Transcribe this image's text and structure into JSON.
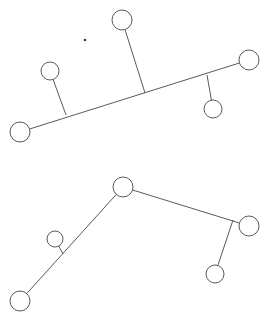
{
  "canvas": {
    "width": 272,
    "height": 322,
    "background": "#ffffff",
    "stroke_color": "#5a5a5a",
    "node_fill": "#ffffff",
    "stroke_width": 1
  },
  "diagram": {
    "type": "node-link-diagram",
    "graphs": [
      {
        "id": "graph-top",
        "label": "top-skeleton",
        "nodes": [
          {
            "id": "t-left-end",
            "name": "bottom-left-endpoint-node",
            "cx": 20,
            "cy": 132,
            "r": 10
          },
          {
            "id": "t-right-end",
            "name": "right-endpoint-node",
            "cx": 249,
            "cy": 60,
            "r": 10
          },
          {
            "id": "t-top",
            "name": "top-branch-node",
            "cx": 122,
            "cy": 20,
            "r": 10
          },
          {
            "id": "t-upper-left",
            "name": "upper-left-branch-node",
            "cx": 50,
            "cy": 71,
            "r": 9
          },
          {
            "id": "t-lower-right",
            "name": "lower-right-branch-node",
            "cx": 213,
            "cy": 109,
            "r": 9
          }
        ],
        "junctions": [
          {
            "id": "t-j-left",
            "name": "left-branch-junction",
            "x": 66,
            "y": 115
          },
          {
            "id": "t-j-mid",
            "name": "mid-branch-junction",
            "x": 145,
            "y": 93
          },
          {
            "id": "t-j-right",
            "name": "right-branch-junction",
            "x": 207,
            "y": 75
          }
        ],
        "edges": [
          {
            "id": "t-e-spine",
            "name": "main-diagonal-spine-edge",
            "from": "t-left-end",
            "to": "t-right-end"
          },
          {
            "id": "t-e-left",
            "name": "left-branch-edge",
            "from": "t-upper-left",
            "to": "t-j-left"
          },
          {
            "id": "t-e-mid",
            "name": "mid-branch-edge",
            "from": "t-top",
            "to": "t-j-mid"
          },
          {
            "id": "t-e-right",
            "name": "right-branch-edge",
            "from": "t-lower-right",
            "to": "t-j-right"
          }
        ]
      },
      {
        "id": "graph-bottom",
        "label": "bottom-skeleton",
        "nodes": [
          {
            "id": "b-apex",
            "name": "apex-node",
            "cx": 123,
            "cy": 187,
            "r": 10
          },
          {
            "id": "b-left-end",
            "name": "bottom-left-endpoint-node",
            "cx": 20,
            "cy": 301,
            "r": 10
          },
          {
            "id": "b-right-end",
            "name": "right-endpoint-node",
            "cx": 249,
            "cy": 226,
            "r": 10
          },
          {
            "id": "b-left-branch",
            "name": "left-branch-node",
            "cx": 55,
            "cy": 239,
            "r": 8
          },
          {
            "id": "b-lower-right",
            "name": "lower-right-branch-node",
            "cx": 215,
            "cy": 274,
            "r": 9
          }
        ],
        "junctions": [
          {
            "id": "b-j-left",
            "name": "left-branch-junction",
            "x": 63,
            "y": 254
          },
          {
            "id": "b-j-right",
            "name": "right-branch-junction",
            "x": 233,
            "y": 220
          }
        ],
        "edges": [
          {
            "id": "b-e-left-arm",
            "name": "left-arm-edge",
            "from": "b-left-end",
            "to": "b-apex"
          },
          {
            "id": "b-e-right-arm",
            "name": "right-arm-edge",
            "from": "b-apex",
            "to": "b-right-end"
          },
          {
            "id": "b-e-left-br",
            "name": "left-branch-edge",
            "from": "b-left-branch",
            "to": "b-j-left"
          },
          {
            "id": "b-e-right-br",
            "name": "right-branch-edge",
            "from": "b-lower-right",
            "to": "b-j-right"
          }
        ]
      }
    ],
    "artifacts": [
      {
        "id": "speck-1",
        "name": "stray-dot-mark",
        "cx": 85,
        "cy": 40,
        "r": 1.3
      }
    ]
  }
}
